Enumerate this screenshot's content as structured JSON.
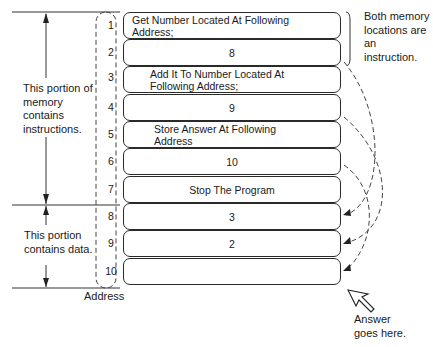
{
  "memory": {
    "cells": [
      {
        "address": "1",
        "content": "Get Number Located At Following Address;"
      },
      {
        "address": "2",
        "content": "8"
      },
      {
        "address": "3",
        "content": "Add It To Number Located At Following Address;"
      },
      {
        "address": "4",
        "content": "9"
      },
      {
        "address": "5",
        "content": "Store Answer At Following Address"
      },
      {
        "address": "6",
        "content": "10"
      },
      {
        "address": "7",
        "content": "Stop The Program"
      },
      {
        "address": "8",
        "content": "3"
      },
      {
        "address": "9",
        "content": "2"
      },
      {
        "address": "10",
        "content": ""
      }
    ],
    "address_label": "Address"
  },
  "annotations": {
    "instructions_region": "This portion of memory contains instructions.",
    "data_region": "This portion contains data.",
    "both_locations": "Both memory locations are an instruction.",
    "answer": "Answer goes here."
  },
  "colors": {
    "line": "#2a2a2a",
    "background": "#ffffff"
  }
}
